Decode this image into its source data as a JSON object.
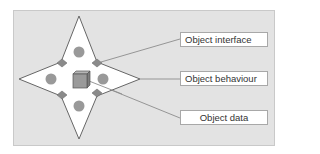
{
  "diagram": {
    "labels": [
      {
        "id": "interface",
        "text": "Object interface"
      },
      {
        "id": "behaviour",
        "text": "Object behaviour"
      },
      {
        "id": "data",
        "text": "Object data"
      }
    ]
  },
  "colors": {
    "panel_background": "#e3e3e3",
    "star_fill": "#ffffff",
    "star_stroke": "#666666",
    "circle_fill": "#999999",
    "diamond_fill": "#8a8a8a",
    "cube_fill": "#9a9a9a",
    "connector_line": "#8c8c8c"
  }
}
